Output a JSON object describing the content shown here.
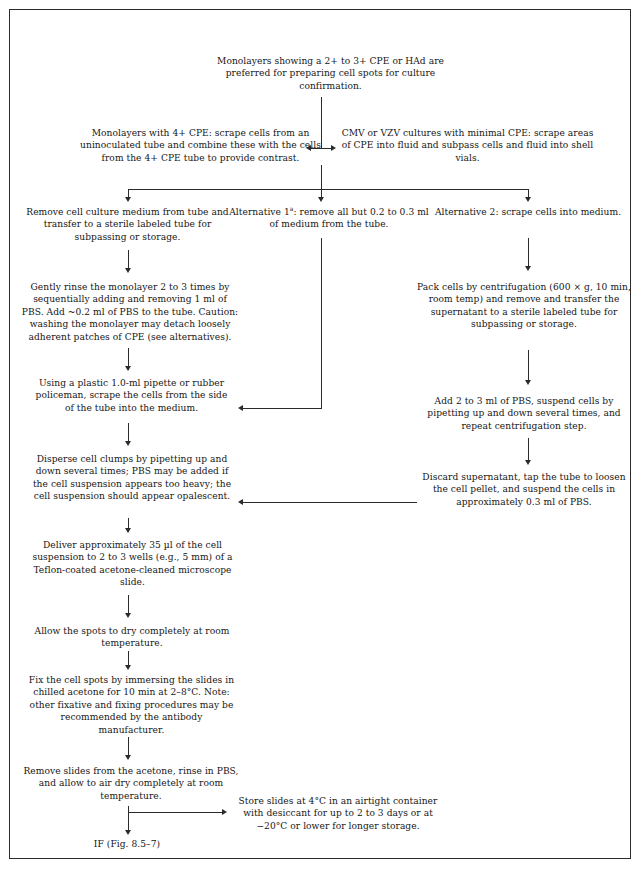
{
  "figure": {
    "type": "flowchart",
    "border_color": "#2b2b2b",
    "text_color": "#161616",
    "background": "#ffffff"
  },
  "nodes": {
    "start": "Monolayers showing a 2+ to 3+ CPE or HAd are preferred for preparing cell spots for culture confirmation.",
    "branch_left": "Monolayers with 4+ CPE: scrape cells from an uninoculated tube and combine these with the cells from the 4+ CPE tube to provide contrast.",
    "branch_right": "CMV or VZV cultures with minimal CPE: scrape areas of CPE into fluid and subpass cells and fluid into shell vials.",
    "col1_remove_medium": "Remove cell culture medium from tube and transfer to a sterile labeled tube for subpassing or storage.",
    "alt1_title": "Alternative 1",
    "alt1_superscript": "a",
    "alt1_rest": ": remove all but 0.2 to 0.3 ml of medium from the tube.",
    "alt2": "Alternative 2: scrape cells into medium.",
    "col1_rinse": "Gently rinse the monolayer 2 to 3 times by sequentially adding and removing 1 ml of PBS. Add ~0.2 ml of PBS to the tube. Caution: washing the monolayer may detach loosely adherent patches of CPE (see alternatives).",
    "col3_pack": "Pack cells by centrifugation (600 × g, 10 min, room temp) and remove and transfer the supernatant to a sterile labeled tube for subpassing or storage.",
    "col1_scrape": "Using a plastic 1.0-ml pipette or rubber policeman, scrape the cells from the side of the tube into the medium.",
    "col3_add_pbs": "Add 2 to 3 ml of PBS, suspend cells by pipetting up and down several times, and repeat centrifugation step.",
    "col1_disperse": "Disperse cell clumps by pipetting up and down several times; PBS may be added if the cell suspension appears too heavy; the cell suspension should appear opalescent.",
    "col3_discard": "Discard supernatant, tap the tube to loosen the cell pellet, and suspend the cells in approximately 0.3 ml of PBS.",
    "col1_deliver": "Deliver approximately 35 µl of the cell suspension to 2 to 3 wells (e.g., 5 mm) of a Teflon-coated acetone-cleaned microscope slide.",
    "col1_dry": "Allow the spots to dry completely at room temperature.",
    "col1_fix": "Fix the cell spots by immersing the slides in chilled acetone for 10 min at 2–8°C. Note: other fixative and fixing procedures may be recommended by the antibody manufacturer.",
    "col1_remove_slides": "Remove slides from the acetone, rinse in PBS, and allow to air dry completely at room temperature.",
    "store": "Store slides at 4°C in an airtight container with desiccant for up to 2 to 3 days or at −20°C or lower for longer storage.",
    "end": "IF (Fig. 8.5–7)"
  }
}
